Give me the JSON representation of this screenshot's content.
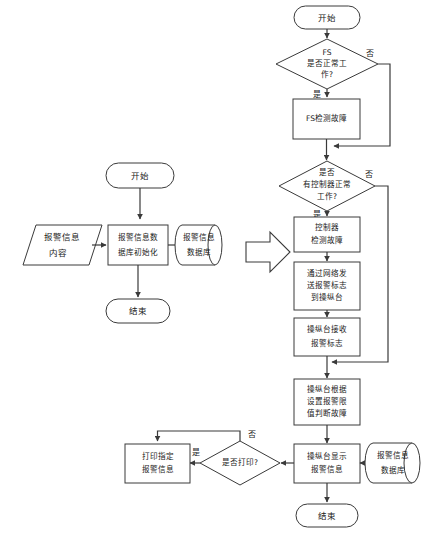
{
  "page": {
    "background_color": "#ffffff",
    "line_color": "#3a3a3a",
    "shape_fill": "#ffffff",
    "text_color": "#1a1a1a"
  },
  "left_flowchart": {
    "name": "报警信息数据库初始化流程",
    "nodes": {
      "start": {
        "type": "terminator",
        "label": "开始"
      },
      "input_data": {
        "type": "input-parallelogram",
        "label": [
          "报警信息",
          "内容"
        ]
      },
      "process_init": {
        "type": "process",
        "label": [
          "报警信息数",
          "据库初始化"
        ]
      },
      "database": {
        "type": "database-cylinder",
        "label": [
          "报警信息",
          "数据库"
        ]
      },
      "end": {
        "type": "terminator",
        "label": "结束"
      }
    }
  },
  "transition_arrow": {
    "name": "block-arrow",
    "direction": "right"
  },
  "right_flowchart": {
    "name": "报警检测与显示流程",
    "nodes": {
      "start": {
        "type": "terminator",
        "label": "开始"
      },
      "decision_fs": {
        "type": "decision",
        "label": [
          "FS",
          "是否正常工",
          "作?"
        ]
      },
      "process_fs_fault": {
        "type": "process",
        "label": [
          "FS检测故障"
        ]
      },
      "decision_controller": {
        "type": "decision",
        "label": [
          "是否",
          "有控制器正常",
          "工作?"
        ]
      },
      "process_controller_fault": {
        "type": "process",
        "label": [
          "控制器",
          "检测故障"
        ]
      },
      "process_send_flag": {
        "type": "process",
        "label": [
          "通过网络发",
          "送报警标志",
          "到操纵台"
        ]
      },
      "process_receive_flag": {
        "type": "process",
        "label": [
          "操纵台接收",
          "报警标志"
        ]
      },
      "process_judge_fault": {
        "type": "process",
        "label": [
          "操纵台根据",
          "设置报警限",
          "值判断故障"
        ]
      },
      "process_display": {
        "type": "process",
        "label": [
          "操纵台显示",
          "报警信息"
        ]
      },
      "decision_print": {
        "type": "decision",
        "label": [
          "是否打印?"
        ]
      },
      "process_print": {
        "type": "process",
        "label": [
          "打印指定",
          "报警信息"
        ]
      },
      "database": {
        "type": "database-cylinder",
        "label": [
          "报警信息",
          "数据库"
        ]
      },
      "end": {
        "type": "terminator",
        "label": "结束"
      }
    },
    "edge_labels": {
      "fs_no": "否",
      "fs_yes": "是",
      "controller_no": "否",
      "controller_yes": "是",
      "print_yes": "是",
      "print_no": "否"
    }
  }
}
